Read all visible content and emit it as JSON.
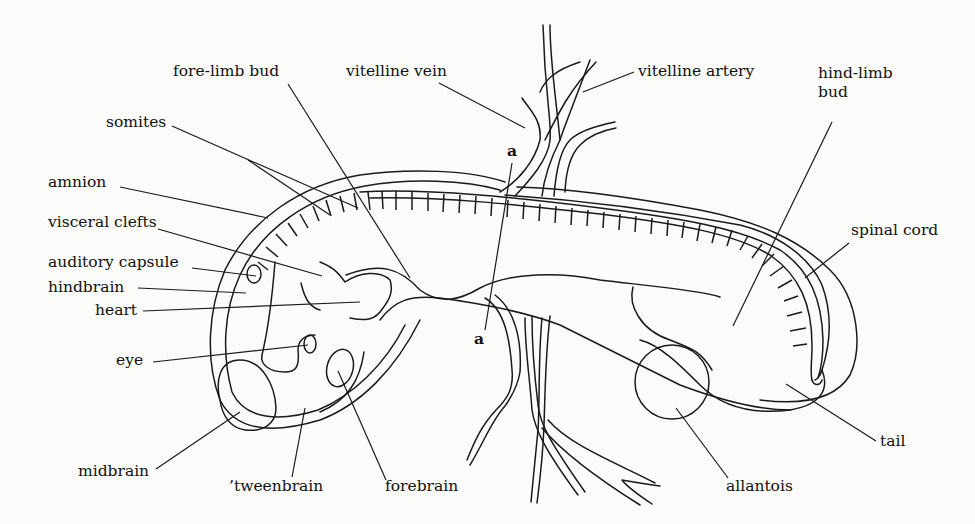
{
  "diagram": {
    "labels": {
      "fore_limb_bud": "fore-limb bud",
      "vitelline_vein": "vitelline vein",
      "vitelline_artery": "vitelline artery",
      "hind_limb_bud": "hind-limb\nbud",
      "somites": "somites",
      "amnion": "amnion",
      "visceral_clefts": "visceral clefts",
      "auditory_capsule": "auditory capsule",
      "hindbrain": "hindbrain",
      "heart": "heart",
      "eye": "eye",
      "midbrain": "midbrain",
      "tweenbrain": "’tweenbrain",
      "forebrain": "forebrain",
      "spinal_cord": "spinal cord",
      "tail": "tail",
      "allantois": "allantois"
    },
    "section_marker": {
      "top": "a",
      "bottom": "a"
    },
    "colors": {
      "ink": "#1a1a1a",
      "paper": "#fbfbf9"
    }
  }
}
